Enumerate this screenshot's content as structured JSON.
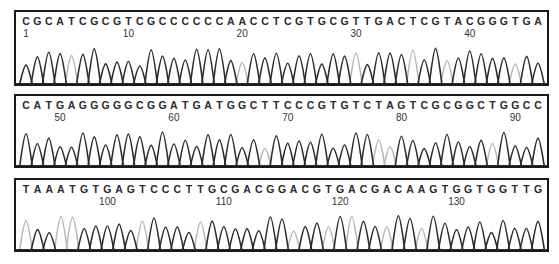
{
  "panels": [
    {
      "sequence": "CGCATCGCGTCGCCCCCCAACCTCGTGCGTTGACTCGTACGGGTGA",
      "start": 1,
      "position_labels": [
        "1",
        "10",
        "20",
        "30",
        "40"
      ],
      "position_indices": [
        0,
        9,
        19,
        29,
        39
      ]
    },
    {
      "sequence": "CATGAGGGGGCGGATGATGGCTTCCCGTGTCTAGTCGCGGCTGGCC",
      "start": 47,
      "position_labels": [
        "50",
        "60",
        "70",
        "80",
        "90"
      ],
      "position_indices": [
        3,
        13,
        23,
        33,
        43
      ]
    },
    {
      "sequence": "TAAATGTGAGTCCCTTGCGACGGACGTGACGACAAGTGGTGGTTG",
      "start": 93,
      "position_labels": [
        "100",
        "110",
        "120",
        "130"
      ],
      "position_indices": [
        7,
        17,
        27,
        37
      ]
    }
  ],
  "colors": {
    "dark_trace": "#2b2b2b",
    "light_trace": "#b8b8b8",
    "border": "#1a1a1a"
  }
}
